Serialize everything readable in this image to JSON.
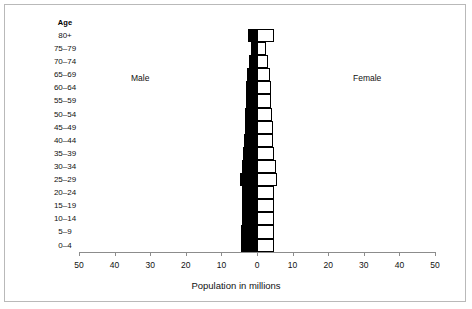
{
  "figure": {
    "age_header": "Age",
    "male_label": "Male",
    "female_label": "Female",
    "x_axis_title": "Population in millions"
  },
  "chart_data": {
    "type": "bar",
    "subtype": "population-pyramid",
    "title": "",
    "xlabel": "Population in millions",
    "ylabel": "Age",
    "categories": [
      "80+",
      "75–79",
      "70–74",
      "65–69",
      "60–64",
      "55–59",
      "50–54",
      "45–49",
      "40–44",
      "35–39",
      "30–34",
      "25–29",
      "20–24",
      "15–19",
      "10–14",
      "5–9",
      "0–4"
    ],
    "series": [
      {
        "name": "Male",
        "color": "#000000",
        "side": "left",
        "values": [
          2.4,
          1.7,
          2.2,
          2.8,
          3.0,
          3.2,
          3.4,
          3.5,
          3.7,
          3.9,
          4.3,
          4.7,
          4.2,
          4.2,
          4.3,
          4.4,
          4.5
        ]
      },
      {
        "name": "Female",
        "color": "#ffffff",
        "side": "right",
        "values": [
          4.7,
          2.6,
          3.0,
          3.6,
          3.8,
          4.0,
          4.2,
          4.4,
          4.6,
          4.8,
          5.2,
          5.5,
          4.9,
          4.8,
          4.8,
          4.8,
          4.9
        ]
      }
    ],
    "x_ticks": [
      {
        "label": "50",
        "value": -50
      },
      {
        "label": "40",
        "value": -40
      },
      {
        "label": "30",
        "value": -30
      },
      {
        "label": "20",
        "value": -20
      },
      {
        "label": "10",
        "value": -10
      },
      {
        "label": "0",
        "value": 0
      },
      {
        "label": "10",
        "value": 10
      },
      {
        "label": "20",
        "value": 20
      },
      {
        "label": "30",
        "value": 30
      },
      {
        "label": "40",
        "value": 40
      },
      {
        "label": "50",
        "value": 50
      }
    ],
    "xlim": [
      -50,
      50
    ],
    "grid": false,
    "legend": "inline-annotations"
  }
}
